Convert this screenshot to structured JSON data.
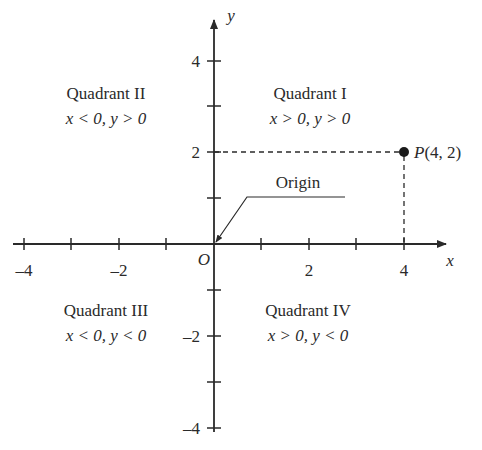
{
  "diagram": {
    "type": "cartesian-plane",
    "axes": {
      "x_label": "x",
      "y_label": "y",
      "origin_label": "O",
      "x_ticks": [
        {
          "value": -4,
          "label": "–4"
        },
        {
          "value": -3,
          "label": ""
        },
        {
          "value": -2,
          "label": "–2"
        },
        {
          "value": -1,
          "label": ""
        },
        {
          "value": 1,
          "label": ""
        },
        {
          "value": 2,
          "label": "2"
        },
        {
          "value": 3,
          "label": ""
        },
        {
          "value": 4,
          "label": "4"
        }
      ],
      "y_ticks": [
        {
          "value": 4,
          "label": "4"
        },
        {
          "value": 3,
          "label": ""
        },
        {
          "value": 2,
          "label": "2"
        },
        {
          "value": 1,
          "label": ""
        },
        {
          "value": -1,
          "label": ""
        },
        {
          "value": -2,
          "label": "–2"
        },
        {
          "value": -3,
          "label": ""
        },
        {
          "value": -4,
          "label": "–4"
        }
      ]
    },
    "quadrants": {
      "q1": {
        "name": "Quadrant I",
        "condition": "x > 0, y > 0"
      },
      "q2": {
        "name": "Quadrant II",
        "condition": "x < 0, y > 0"
      },
      "q3": {
        "name": "Quadrant III",
        "condition": "x < 0, y < 0"
      },
      "q4": {
        "name": "Quadrant IV",
        "condition": "x > 0, y < 0"
      }
    },
    "point": {
      "label": "P(4, 2)",
      "x": 4,
      "y": 2
    },
    "origin_callout": "Origin",
    "colors": {
      "ink": "#2a2a2a",
      "background": "#ffffff"
    }
  }
}
